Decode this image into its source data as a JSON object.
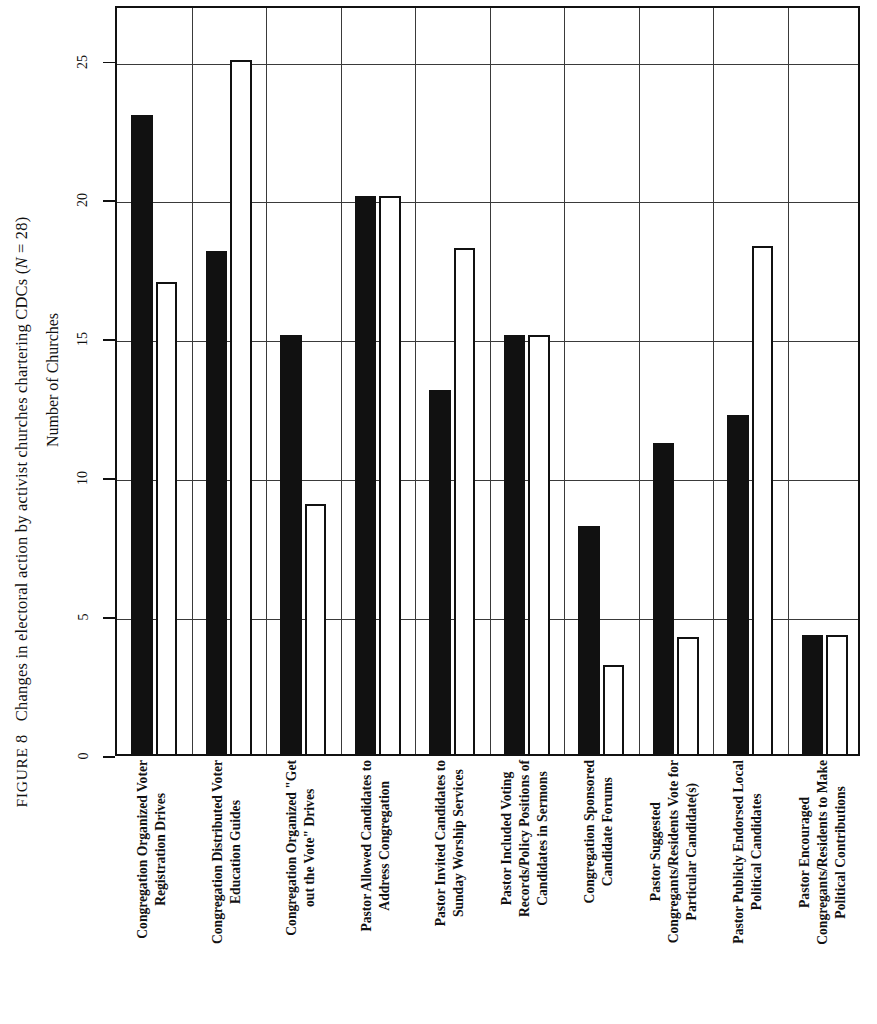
{
  "figure": {
    "label_word": "FIGURE",
    "number": "8",
    "caption": "Changes in electoral action by activist churches chartering CDCs (",
    "n_italic": "N",
    "caption_tail": " = 28)"
  },
  "axis": {
    "value_axis_title": "Number of Churches",
    "ticks": [
      "0",
      "5",
      "10",
      "15",
      "20",
      "25"
    ]
  },
  "legend": {
    "series_filled": "Before",
    "series_hollow": "After"
  },
  "chart_data": {
    "type": "bar",
    "title": "FIGURE 8  Changes in electoral action by activist churches chartering CDCs (N = 28)",
    "xlabel": "",
    "ylabel": "Number of Churches",
    "ylim": [
      0,
      27
    ],
    "yticks": [
      0,
      5,
      10,
      15,
      20,
      25
    ],
    "grid": true,
    "legend_position": "none",
    "orientation": "rotated-90",
    "categories": [
      "Congregation Organized Voter Registration Drives",
      "Congregation Distributed Voter Education Guides",
      "Congregation Organized \"Get out the Vote\" Drives",
      "Pastor Allowed Candidates to Address Congregation",
      "Pastor Invited Candidates to Sunday Worship Services",
      "Pastor Included Voting Records/Policy Positions of Candidates in Sermons",
      "Congregation Sponsored Candidate Forums",
      "Pastor Suggested Congregants/Residents Vote for Particular Candidate(s)",
      "Pastor Publicly Endorsed Local Political Candidates",
      "Pastor Encouraged Congregants/Residents to Make Political Contributions"
    ],
    "series": [
      {
        "name": "filled",
        "values": [
          23,
          18.1,
          15.1,
          20.1,
          13.1,
          15.1,
          8.2,
          11.2,
          12.2,
          4.3
        ]
      },
      {
        "name": "hollow",
        "values": [
          17,
          25,
          9,
          20.1,
          18.2,
          15.1,
          3.2,
          4.2,
          18.3,
          4.3
        ]
      }
    ]
  },
  "categories_display": [
    {
      "line1": "Congregation Organized Voter",
      "line2": "Registration Drives"
    },
    {
      "line1": "Congregation Distributed Voter",
      "line2": "Education Guides"
    },
    {
      "line1": "Congregation Organized \"Get",
      "line2": "out the Vote\" Drives"
    },
    {
      "line1": "Pastor Allowed Candidates to",
      "line2": "Address Congregation"
    },
    {
      "line1": "Pastor Invited Candidates to",
      "line2": "Sunday Worship Services"
    },
    {
      "line1": "Pastor Included Voting",
      "line2": "Records/Policy Positions of",
      "line3": "Candidates in Sermons"
    },
    {
      "line1": "Congregation Sponsored",
      "line2": "Candidate Forums"
    },
    {
      "line1": "Pastor Suggested",
      "line2": "Congregants/Residents Vote for",
      "line3": "Particular Candidate(s)"
    },
    {
      "line1": "Pastor Publicly Endorsed Local",
      "line2": "Political Candidates"
    },
    {
      "line1": "Pastor Encouraged",
      "line2": "Congregants/Residents to Make",
      "line3": "Political Contributions"
    }
  ],
  "colors": {
    "ink": "#111111",
    "grid": "#3a3a3a",
    "paper": "#ffffff"
  }
}
